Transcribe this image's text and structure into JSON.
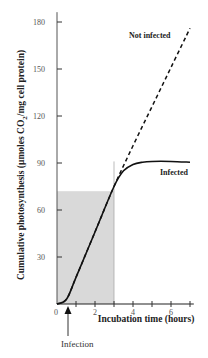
{
  "chart_data": {
    "type": "line",
    "title": "",
    "xlabel": "Incubation time (hours)",
    "ylabel": "Cumulative photosynthesis (µmoles CO2/mg cell protein)",
    "ylabel_parts": {
      "pre": "Cumulative photosynthesis  (µmoles CO",
      "sub": "2",
      "post": "/mg cell protein)"
    },
    "xlim": [
      0,
      7.2
    ],
    "ylim": [
      0,
      185
    ],
    "x_ticks": [
      0,
      2,
      4,
      6
    ],
    "x_minor_ticks": [
      1,
      3,
      5,
      7
    ],
    "y_ticks": [
      30,
      60,
      90,
      120,
      150,
      180
    ],
    "grid": false,
    "legend_position": "inline labels",
    "series": [
      {
        "name": "Not infected",
        "style": "dashed",
        "x": [
          0,
          0.5,
          1,
          2,
          3,
          4,
          5,
          6,
          7
        ],
        "y": [
          0,
          3,
          17,
          46,
          75,
          101,
          126,
          151,
          176
        ]
      },
      {
        "name": "Infected",
        "style": "solid",
        "x": [
          0,
          0.5,
          1,
          2,
          3,
          3.5,
          4,
          4.5,
          5,
          6,
          7
        ],
        "y": [
          0,
          3,
          17,
          46,
          75,
          85,
          89,
          90.5,
          91,
          91,
          90.5
        ]
      }
    ],
    "shaded_region": {
      "x": [
        0,
        3
      ],
      "y": [
        0,
        72
      ],
      "color": "#d9d9d9"
    },
    "reference_line": {
      "x": 3,
      "y_top": 91
    },
    "annotations": [
      {
        "text": "Infection",
        "x": 0.6,
        "type": "arrow"
      }
    ]
  },
  "labels": {
    "infection": "Infection",
    "not_infected": "Not infected",
    "infected": "Infected"
  }
}
